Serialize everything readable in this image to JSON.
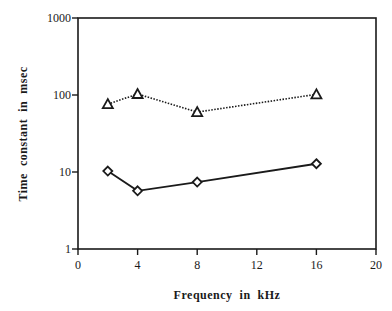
{
  "chart_data": {
    "type": "line",
    "title": "",
    "xlabel": "Frequency  in  kHz",
    "ylabel": "Time  constant  in  msec",
    "xlim": [
      0,
      20
    ],
    "ylim": [
      1,
      1000
    ],
    "yscale": "log",
    "xticks": [
      "0",
      "4",
      "8",
      "12",
      "16",
      "20"
    ],
    "yticks": [
      "1",
      "10",
      "100",
      "1000"
    ],
    "grid": false,
    "legend": null,
    "series": [
      {
        "name": "triangles (dotted)",
        "marker": "triangle",
        "linestyle": "dotted",
        "x": [
          2,
          4,
          8,
          16
        ],
        "values": [
          76,
          103,
          60,
          102
        ]
      },
      {
        "name": "diamonds (solid)",
        "marker": "diamond",
        "linestyle": "solid",
        "x": [
          2,
          4,
          8,
          16
        ],
        "values": [
          10.3,
          5.7,
          7.4,
          12.8
        ]
      }
    ]
  },
  "axes": {
    "xlabel": "Frequency  in  kHz",
    "ylabel": "Time  constant  in  msec"
  }
}
